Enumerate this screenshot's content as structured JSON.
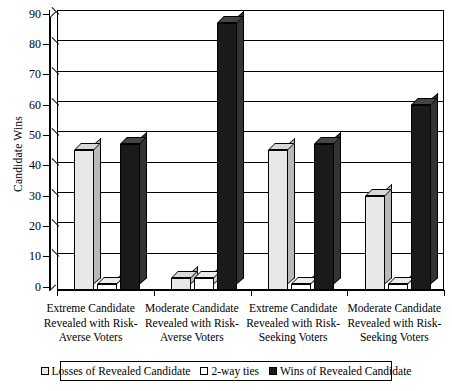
{
  "chart_data": {
    "type": "bar",
    "title": "",
    "subtitle": "",
    "xlabel": "",
    "ylabel": "Candidate Wins",
    "ylim": [
      0,
      90
    ],
    "ytick_step": 10,
    "yticks": [
      0,
      10,
      20,
      30,
      40,
      50,
      60,
      70,
      80,
      90
    ],
    "grid": true,
    "grid_axis": "y",
    "legend_position": "bottom",
    "style": "3d-clustered-column",
    "categories": [
      "Extreme Candidate Revealed with Risk-Averse Voters",
      "Moderate Candidate Revealed with Risk-Averse Voters",
      "Extreme Candidate Revealed with Risk-Seeking Voters",
      "Moderate Candidate Revealed with Risk-Seeking Voters"
    ],
    "category_lines": [
      [
        "Extreme Candidate",
        "Revealed with Risk-",
        "Averse Voters"
      ],
      [
        "Moderate Candidate",
        "Revealed with Risk-",
        "Averse Voters"
      ],
      [
        "Extreme Candidate",
        "Revealed with Risk-",
        "Seeking Voters"
      ],
      [
        "Moderate Candidate",
        "Revealed with Risk-",
        "Seeking Voters"
      ]
    ],
    "series": [
      {
        "name": "Losses of Revealed Candidate",
        "color": "#e8e8e8",
        "values": [
          46,
          4,
          46,
          31
        ]
      },
      {
        "name": "2-way ties",
        "color": "#ffffff",
        "values": [
          2,
          4,
          2,
          2
        ]
      },
      {
        "name": "Wins of Revealed Candidate",
        "color": "#1a1a1a",
        "values": [
          48,
          88,
          48,
          61
        ]
      }
    ]
  },
  "legend": {
    "items": [
      {
        "label": "Losses of Revealed Candidate",
        "swatch": "#e8e8e8"
      },
      {
        "label": "2-way ties",
        "swatch": "#ffffff"
      },
      {
        "label": "Wins of Revealed Candidate",
        "swatch": "#1a1a1a"
      }
    ]
  }
}
